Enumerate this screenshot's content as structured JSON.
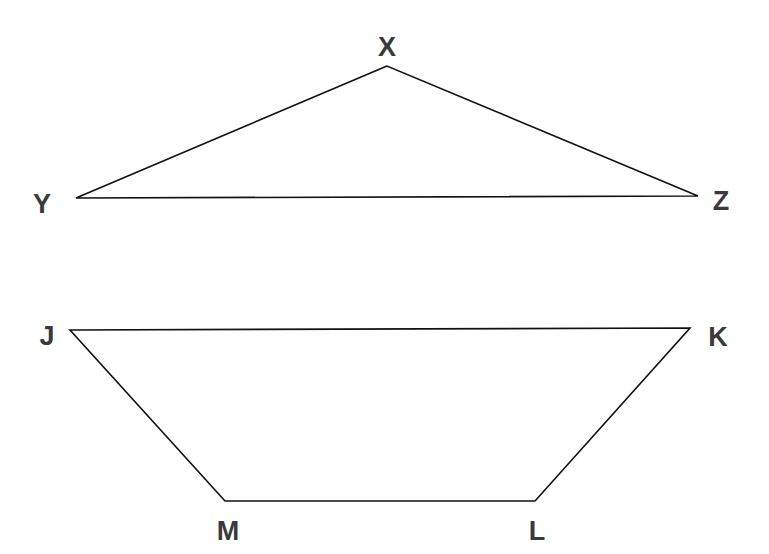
{
  "colors": {
    "line": "#111111",
    "label": "#3a3a3a",
    "background": "#ffffff"
  },
  "figures": [
    {
      "name": "triangle-XYZ",
      "type": "triangle",
      "vertices": [
        {
          "label": "X",
          "x": 387,
          "y": 66,
          "label_x": 387,
          "label_y": 47
        },
        {
          "label": "Y",
          "x": 76,
          "y": 198,
          "label_x": 42,
          "label_y": 204
        },
        {
          "label": "Z",
          "x": 698,
          "y": 196,
          "label_x": 721,
          "label_y": 201
        }
      ]
    },
    {
      "name": "trapezoid-JKLM",
      "type": "trapezoid",
      "vertices": [
        {
          "label": "J",
          "x": 70,
          "y": 330,
          "label_x": 47,
          "label_y": 336
        },
        {
          "label": "K",
          "x": 690,
          "y": 328,
          "label_x": 718,
          "label_y": 337
        },
        {
          "label": "L",
          "x": 535,
          "y": 501,
          "label_x": 537,
          "label_y": 531
        },
        {
          "label": "M",
          "x": 225,
          "y": 501,
          "label_x": 228,
          "label_y": 531
        }
      ]
    }
  ]
}
